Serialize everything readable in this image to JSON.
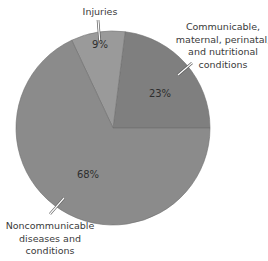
{
  "chart_data": {
    "type": "pie",
    "title": "",
    "categories": [
      "Communicable, maternal, perinatal, and nutritional conditions",
      "Injuries",
      "Noncommunicable diseases and conditions"
    ],
    "values": [
      23,
      9,
      68
    ],
    "unit": "%",
    "start_angle_deg": 0,
    "direction": "counterclockwise",
    "colors": [
      "#7f7f7f",
      "#9a9a9a",
      "#8b8b8b"
    ],
    "legend": "none (direct labels with leader lines)",
    "slices": [
      {
        "name": "communicable",
        "label_lines": [
          "Communicable,",
          "maternal, perinatal,",
          "and nutritional",
          "conditions"
        ],
        "value_label": "23%",
        "value": 23,
        "color": "#7f7f7f"
      },
      {
        "name": "injuries",
        "label_lines": [
          "Injuries"
        ],
        "value_label": "9%",
        "value": 9,
        "color": "#9a9a9a"
      },
      {
        "name": "noncommunicable",
        "label_lines": [
          "Noncommunicable",
          "diseases and",
          "conditions"
        ],
        "value_label": "68%",
        "value": 68,
        "color": "#8b8b8b"
      }
    ]
  },
  "style": {
    "background": "#ffffff",
    "leader_color": "#ffffff",
    "leader_shadow": "#5a5a5a",
    "slice_edge": "#6e6e6e"
  }
}
